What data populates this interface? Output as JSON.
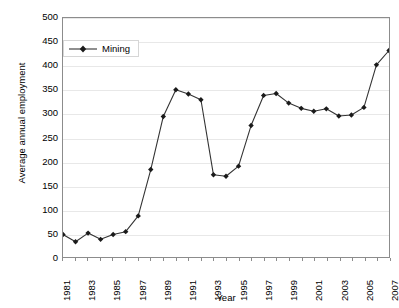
{
  "chart_data": {
    "type": "line",
    "title": "",
    "xlabel": "Year",
    "ylabel": "Average annual employment",
    "xlim": [
      1981,
      2007
    ],
    "ylim": [
      0,
      500
    ],
    "ytick_step": 50,
    "yticks": [
      500,
      450,
      400,
      350,
      300,
      250,
      200,
      150,
      100,
      50,
      0
    ],
    "xticks": [
      1981,
      1982,
      1983,
      1984,
      1985,
      1986,
      1987,
      1988,
      1989,
      1990,
      1991,
      1992,
      1993,
      1994,
      1995,
      1996,
      1997,
      1998,
      1999,
      2000,
      2001,
      2002,
      2003,
      2004,
      2005,
      2006,
      2007
    ],
    "xtick_labels": [
      "1981",
      "",
      "1983",
      "",
      "1985",
      "",
      "1987",
      "",
      "1989",
      "",
      "1991",
      "",
      "1993",
      "",
      "1995",
      "",
      "1997",
      "",
      "1999",
      "",
      "2001",
      "",
      "2003",
      "",
      "2005",
      "",
      "2007"
    ],
    "grid": true,
    "grid_axis": "y",
    "legend_position": "top-left",
    "marker": "diamond",
    "line_color": "#333333",
    "marker_color": "#1a1a1a",
    "grid_color": "#e8e8e8",
    "frame_color": "#8c8c8c",
    "categories": [
      1981,
      1982,
      1983,
      1984,
      1985,
      1986,
      1987,
      1988,
      1989,
      1990,
      1991,
      1992,
      1993,
      1994,
      1995,
      1996,
      1997,
      1998,
      1999,
      2000,
      2001,
      2002,
      2003,
      2004,
      2005,
      2006,
      2007
    ],
    "series": [
      {
        "name": "Mining",
        "values": [
          47,
          32,
          50,
          37,
          47,
          53,
          86,
          183,
          294,
          350,
          341,
          329,
          172,
          169,
          190,
          275,
          338,
          342,
          322,
          311,
          305,
          310,
          295,
          297,
          313,
          402,
          432
        ]
      }
    ]
  },
  "legend": {
    "entries": [
      {
        "label": "Mining"
      }
    ]
  },
  "axes": {
    "y_title": "Average annual employment",
    "x_title": "Year"
  }
}
